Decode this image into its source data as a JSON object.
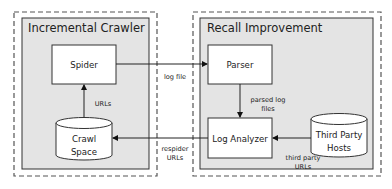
{
  "diagram": {
    "groups": [
      {
        "id": "incremental-crawler",
        "title": "Incremental Crawler"
      },
      {
        "id": "recall-improvement",
        "title": "Recall Improvement"
      }
    ],
    "nodes": {
      "spider": {
        "label": "Spider",
        "shape": "rectangle",
        "group": "incremental-crawler"
      },
      "crawl_space": {
        "label_line1": "Crawl",
        "label_line2": "Space",
        "shape": "cylinder",
        "group": "incremental-crawler"
      },
      "parser": {
        "label": "Parser",
        "shape": "rectangle",
        "group": "recall-improvement"
      },
      "log_analyzer": {
        "label": "Log Analyzer",
        "shape": "rectangle",
        "group": "recall-improvement"
      },
      "third_party_hosts": {
        "label_line1": "Third Party",
        "label_line2": "Hosts",
        "shape": "cylinder",
        "group": "recall-improvement"
      }
    },
    "edges": {
      "spider_to_parser": {
        "from": "Spider",
        "to": "Parser",
        "label": "log file"
      },
      "crawlspace_to_spider": {
        "from": "Crawl Space",
        "to": "Spider",
        "label": "URLs"
      },
      "parser_to_loganalyzer": {
        "from": "Parser",
        "to": "Log Analyzer",
        "label_line1": "parsed log",
        "label_line2": "files"
      },
      "thirdparty_to_loganalyzer": {
        "from": "Third Party Hosts",
        "to": "Log Analyzer",
        "label_line1": "third party",
        "label_line2": "URLs"
      },
      "loganalyzer_to_crawlspace": {
        "from": "Log Analyzer",
        "to": "Crawl Space",
        "label_line1": "respider",
        "label_line2": "URLs"
      }
    },
    "colors": {
      "group_fill": "#e4e4e4",
      "node_fill": "#ffffff",
      "stroke": "#333333",
      "dashed_stroke": "#555555"
    }
  }
}
